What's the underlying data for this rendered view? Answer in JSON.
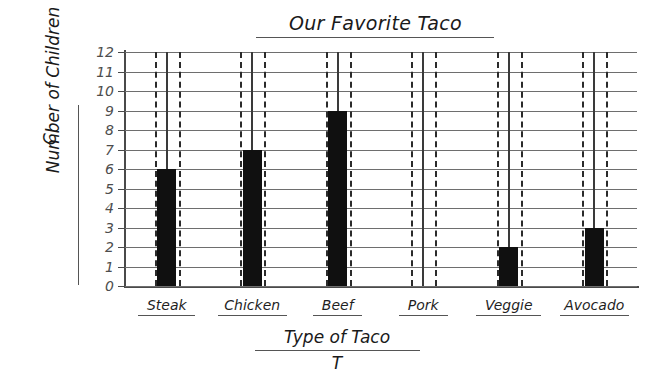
{
  "chart_data": {
    "type": "bar",
    "title": "Our Favorite Taco",
    "categories": [
      "Steak",
      "Chicken",
      "Beef",
      "Pork",
      "Veggie",
      "Avocado"
    ],
    "values": [
      6,
      7,
      9,
      0,
      2,
      3
    ],
    "xlabel": "Type of Taco",
    "xvariable": "T",
    "ylabel": "Number of Children",
    "yvariable": "C",
    "ylim": [
      0,
      12
    ],
    "yticks": [
      0,
      1,
      2,
      3,
      4,
      5,
      6,
      7,
      8,
      9,
      10,
      11,
      12
    ],
    "ytick_labels": [
      "0",
      "1",
      "2",
      "3",
      "4",
      "5",
      "6",
      "7",
      "8",
      "9",
      "10",
      "11",
      "12"
    ],
    "grid": true,
    "grid_axis": "y",
    "legend": null,
    "bar_color": "#101010",
    "grid_color": "#6e6e6e",
    "axis_color": "#4a4a4a",
    "background": "#ffffff",
    "style": "hand-drawn worksheet"
  }
}
